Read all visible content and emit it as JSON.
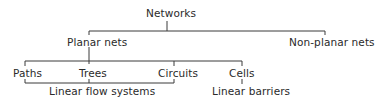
{
  "diagram": {
    "type": "hierarchy-tree",
    "root": {
      "label": "Networks",
      "children": [
        {
          "label": "Planar nets",
          "children": [
            {
              "label": "Paths"
            },
            {
              "label": "Trees"
            },
            {
              "label": "Circuits"
            },
            {
              "label": "Cells"
            }
          ]
        },
        {
          "label": "Non-planar nets"
        }
      ]
    },
    "groupings": [
      {
        "label": "Linear flow systems",
        "members": [
          "Paths",
          "Trees",
          "Circuits"
        ]
      },
      {
        "label": "Linear barriers",
        "members": [
          "Cells"
        ]
      }
    ]
  },
  "labels": {
    "networks": "Networks",
    "planar": "Planar nets",
    "nonplanar": "Non-planar nets",
    "paths": "Paths",
    "trees": "Trees",
    "circuits": "Circuits",
    "cells": "Cells",
    "linear_flow": "Linear flow systems",
    "linear_barriers": "Linear barriers"
  },
  "colors": {
    "line": "#3a3a3a",
    "text": "#2a2a2a",
    "background": "#ffffff"
  }
}
